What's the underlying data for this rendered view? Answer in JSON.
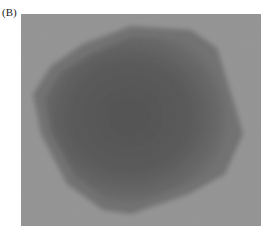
{
  "figure": {
    "panel_label": "(B)",
    "image": {
      "description": "grayscale transmission micrograph of a single roughly polygonal particle",
      "background_color": "#9a9a9a",
      "particle_edge_color": "#6e6e6e",
      "particle_core_color": "#4a4a4a"
    }
  }
}
